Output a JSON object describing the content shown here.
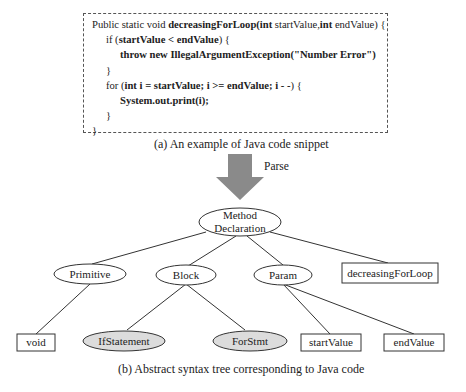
{
  "code_snippet": {
    "lines": [
      {
        "indent": 0,
        "parts": [
          [
            "n",
            "Public static void "
          ],
          [
            "b",
            "decreasingForLoop(int "
          ],
          [
            "n",
            "startValue,"
          ],
          [
            "b",
            "int "
          ],
          [
            "n",
            "endValue) {"
          ]
        ]
      },
      {
        "indent": 1,
        "parts": [
          [
            "n",
            "if ("
          ],
          [
            "b",
            "startValue < endValue"
          ],
          [
            "n",
            ") {"
          ]
        ]
      },
      {
        "indent": 2,
        "parts": [
          [
            "b",
            "throw new IllegalArgumentException(\"Number Error\")"
          ]
        ]
      },
      {
        "indent": 1,
        "parts": [
          [
            "n",
            "}"
          ]
        ]
      },
      {
        "indent": 1,
        "parts": [
          [
            "n",
            "for ("
          ],
          [
            "b",
            "int i = startValue; i >= endValue; i - -"
          ],
          [
            "n",
            ") {"
          ]
        ]
      },
      {
        "indent": 2,
        "parts": [
          [
            "b",
            "System.out.print(i);"
          ]
        ]
      },
      {
        "indent": 1,
        "parts": [
          [
            "n",
            "}"
          ]
        ]
      },
      {
        "indent": 0,
        "parts": [
          [
            "n",
            "}"
          ]
        ]
      }
    ]
  },
  "captions": {
    "a": "(a) An example of  Java code snippet",
    "b": "(b) Abstract syntax tree corresponding to Java code"
  },
  "arrow": {
    "label": "Parse",
    "color": "#8a8a8a"
  },
  "tree": {
    "root": {
      "line1": "Method",
      "line2": "Declaration"
    },
    "level1": {
      "primitive": "Primitive",
      "block": "Block",
      "param": "Param",
      "name": "decreasingForLoop"
    },
    "level2": {
      "void": "void",
      "if_statement": "IfStatement",
      "for_stmt": "ForStmt",
      "start_value": "startValue",
      "end_value": "endValue"
    },
    "colors": {
      "shaded_fill": "#dcdcdc",
      "stroke": "#333333"
    }
  }
}
